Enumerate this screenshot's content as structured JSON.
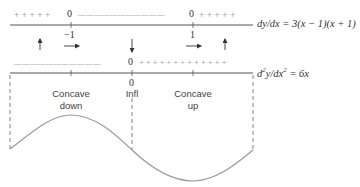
{
  "first_derivative": {
    "equation": "dy/dx = 3(x − 1)(x + 1)",
    "signs": {
      "left": "+ + + + +",
      "middle": "— — — — — — — — — — —",
      "right": "+ + + + +"
    },
    "zeros": [
      "0",
      "0"
    ],
    "tick_labels": [
      "−1",
      "1"
    ],
    "arrows": [
      "up",
      "right",
      "down",
      "right",
      "up"
    ]
  },
  "second_derivative": {
    "equation_prefix": "d",
    "equation_sup1": "2",
    "equation_mid": "y/dx",
    "equation_sup2": "2",
    "equation_suffix": " = 6x",
    "signs": {
      "left": "— — — — — — — — — — —",
      "right": "+ + + + + + + + + + + + +"
    },
    "zero": "0",
    "inflection_zero": "0",
    "inflection_label": "Infl"
  },
  "regions": {
    "left": {
      "line1": "Concave",
      "line2": "down"
    },
    "right": {
      "line1": "Concave",
      "line2": "up"
    }
  },
  "colors": {
    "axis": "#555555",
    "curve": "#9a9a9a",
    "dashes": "#777777",
    "signs": "#a8a8a8",
    "text": "#333333"
  }
}
